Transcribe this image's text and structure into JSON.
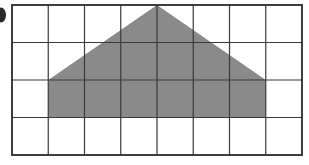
{
  "figure": {
    "title": "",
    "canvas": {
      "width": 309,
      "height": 165,
      "background": "#ffffff"
    },
    "bullet_marker": {
      "name": "clipped-bullet-dot",
      "shape": "ellipse",
      "color": "#2b2b2b",
      "cx": 1,
      "cy": 15,
      "rx": 5,
      "ry": 7.5
    },
    "grid": {
      "columns": 8,
      "rows": 4,
      "left": 12,
      "top": 5,
      "right": 302,
      "bottom": 155,
      "cell_width": 36.25,
      "cell_height": 37.5,
      "line_color": "#3a3a3a",
      "line_width": 1.2,
      "border_color": "#2b2b2b",
      "border_width": 1.8,
      "x_lines": [
        12,
        48.25,
        84.5,
        120.75,
        157,
        193.25,
        229.5,
        265.75,
        302
      ],
      "y_lines": [
        5,
        42.5,
        80,
        117.5,
        155
      ]
    },
    "shape": {
      "name": "shaded-pentagon-house",
      "type": "polygon",
      "fill": "#8a8a8a",
      "stroke": "none",
      "label": "Shaded pentagon (triangle roof on rectangle base)",
      "vertices": [
        {
          "x": 48.25,
          "y": 117.5,
          "grid": "col 1 / row 3 bottom-left"
        },
        {
          "x": 48.25,
          "y": 80,
          "grid": "col 1 / row 2 bottom-left"
        },
        {
          "x": 157,
          "y": 5,
          "grid": "apex at top border, col 4/5 boundary"
        },
        {
          "x": 265.75,
          "y": 80,
          "grid": "col 7 / row 2 bottom-right"
        },
        {
          "x": 265.75,
          "y": 117.5,
          "grid": "col 7 / row 3 bottom-right"
        }
      ],
      "base_width_cells": 6,
      "base_height_cells": 1,
      "roof_height_cells": 2,
      "total_height_cells": 3
    }
  },
  "chart_data": {
    "type": "scatter",
    "title": "",
    "xlabel": "",
    "ylabel": "",
    "grid": true,
    "legend": null,
    "xlim": [
      0,
      8
    ],
    "ylim": [
      0,
      4
    ],
    "xticks": [
      0,
      1,
      2,
      3,
      4,
      5,
      6,
      7,
      8
    ],
    "yticks": [
      0,
      1,
      2,
      3,
      4
    ],
    "annotations": [
      {
        "name": "shaded-pentagon",
        "kind": "polygon",
        "fill": "#8a8a8a",
        "points_grid_units": [
          [
            1,
            1
          ],
          [
            1,
            2
          ],
          [
            4,
            4
          ],
          [
            7,
            2
          ],
          [
            7,
            1
          ]
        ],
        "description": "Grey pentagon resembling a house: rectangle 6 cells wide by 1 cell tall topped by an isosceles triangle 6 cells wide by 2 cells tall with apex on the top grid border."
      }
    ]
  }
}
